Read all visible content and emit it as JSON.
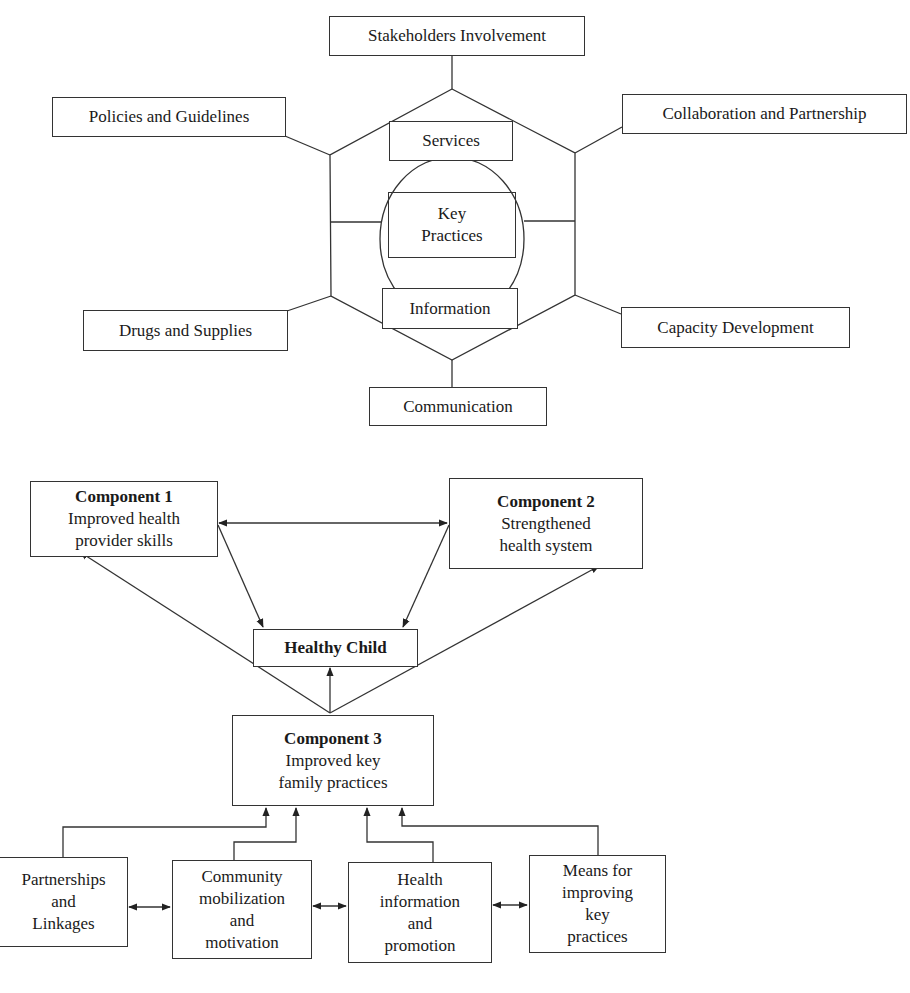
{
  "top_diagram": {
    "center": {
      "core": "Key Practices",
      "core_lines": [
        "Key",
        "Practices"
      ],
      "upper": "Services",
      "lower": "Information"
    },
    "outer_nodes": {
      "top": "Stakeholders Involvement",
      "upper_left": "Policies and Guidelines",
      "upper_right": "Collaboration and Partnership",
      "lower_left": "Drugs and Supplies",
      "lower_right": "Capacity Development",
      "bottom": "Communication"
    }
  },
  "bottom_diagram": {
    "component1": {
      "title": "Component 1",
      "lines": [
        "Improved health",
        "provider skills"
      ]
    },
    "component2": {
      "title": "Component 2",
      "lines": [
        "Strengthened",
        "health system"
      ]
    },
    "component3": {
      "title": "Component 3",
      "lines": [
        "Improved key",
        "family practices"
      ]
    },
    "goal": "Healthy Child",
    "inputs": [
      {
        "lines": [
          "Partnerships",
          "and",
          "Linkages"
        ]
      },
      {
        "lines": [
          "Community",
          "mobilization",
          "and",
          "motivation"
        ]
      },
      {
        "lines": [
          "Health",
          "information",
          "and",
          "promotion"
        ]
      },
      {
        "lines": [
          "Means for",
          "improving",
          "key",
          "practices"
        ]
      }
    ],
    "relations": [
      "Component 1 <-> Component 2",
      "Component 1 -> Healthy Child",
      "Component 2 -> Healthy Child",
      "Component 3 -> Healthy Child",
      "Component 3 -> Component 1",
      "Component 3 -> Component 2",
      "Each input -> Component 3",
      "Adjacent inputs linked bidirectionally"
    ]
  },
  "colors": {
    "line": "#333333",
    "text": "#1a1a1a",
    "background": "#ffffff"
  }
}
